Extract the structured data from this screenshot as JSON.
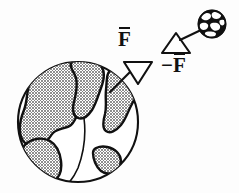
{
  "figure": {
    "name": "newtons-third-law-earth-ball",
    "background_color": "#fdfdfd",
    "ink_color": "#111111",
    "landmass_fill": "#d8d8d8",
    "width": 239,
    "height": 193
  },
  "labels": {
    "force_on_earth": {
      "text": "F",
      "overbar": true,
      "display": "F̄",
      "sign": ""
    },
    "force_on_ball": {
      "text": "F",
      "overbar": true,
      "display": "−F̄",
      "sign": "−"
    }
  },
  "objects": {
    "earth": {
      "name": "earth-globe",
      "description": "large globe with crosshatched continents",
      "center_x": 78,
      "center_y": 122,
      "radius": 61
    },
    "ball": {
      "name": "small-ball-globe",
      "description": "small dark globe with light blobs",
      "center_x": 212,
      "center_y": 24,
      "radius": 14
    },
    "arrowhead_down": {
      "name": "force-arrowhead-on-earth",
      "direction": "down-left",
      "style": "open-triangle"
    },
    "arrowhead_up": {
      "name": "force-arrowhead-on-ball",
      "direction": "up-right",
      "style": "open-triangle"
    }
  }
}
